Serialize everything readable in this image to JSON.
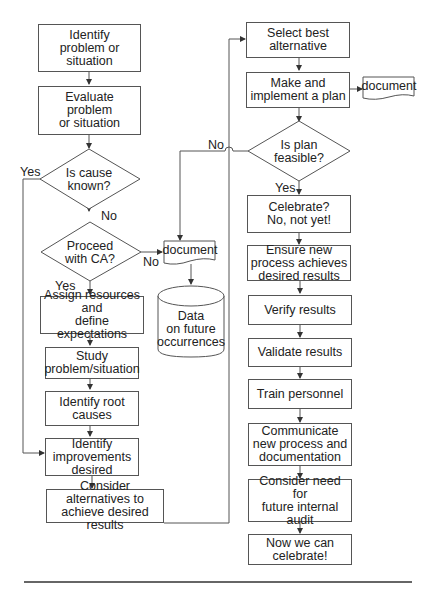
{
  "diagram": {
    "type": "flowchart",
    "nodes": {
      "identify_problem": "Identify\nproblem or\nsituation",
      "evaluate_problem": "Evaluate\nproblem\nor situation",
      "is_cause_known": "Is cause\nknown?",
      "proceed_with_ca": "Proceed\nwith CA?",
      "document_1": "document",
      "data_store": "Data\non future\noccurrences",
      "assign_resources": "Assign resources and\ndefine expectations",
      "study_problem": "Study\nproblem/situation",
      "identify_root_causes": "Identify root\ncauses",
      "identify_improvements": "Identify\nimprovements\ndesired",
      "consider_alternatives": "Consider alternatives to\nachieve desired results",
      "select_best": "Select best\nalternative",
      "make_plan": "Make and\nimplement a plan",
      "document_2": "document",
      "is_plan_feasible": "Is plan\nfeasible?",
      "celebrate_not_yet": "Celebrate?\nNo, not yet!",
      "ensure_process": "Ensure new\nprocess achieves\ndesired results",
      "verify_results": "Verify results",
      "validate_results": "Validate results",
      "train_personnel": "Train personnel",
      "communicate": "Communicate\nnew process and\ndocumentation",
      "consider_audit": "Consider need for\nfuture internal\naudit",
      "now_celebrate": "Now we can\ncelebrate!"
    },
    "edge_labels": {
      "cause_yes": "Yes",
      "cause_no": "No",
      "proceed_yes": "Yes",
      "proceed_no": "No",
      "feasible_no": "No",
      "feasible_yes": "Yes"
    },
    "edges": [
      {
        "from": "identify_problem",
        "to": "evaluate_problem"
      },
      {
        "from": "evaluate_problem",
        "to": "is_cause_known"
      },
      {
        "from": "is_cause_known",
        "to": "proceed_with_ca",
        "label": "No"
      },
      {
        "from": "is_cause_known",
        "to": "identify_improvements",
        "label": "Yes"
      },
      {
        "from": "proceed_with_ca",
        "to": "assign_resources",
        "label": "Yes"
      },
      {
        "from": "proceed_with_ca",
        "to": "document_1",
        "label": "No"
      },
      {
        "from": "document_1",
        "to": "data_store"
      },
      {
        "from": "assign_resources",
        "to": "study_problem"
      },
      {
        "from": "study_problem",
        "to": "identify_root_causes"
      },
      {
        "from": "identify_root_causes",
        "to": "identify_improvements"
      },
      {
        "from": "identify_improvements",
        "to": "consider_alternatives"
      },
      {
        "from": "consider_alternatives",
        "to": "select_best"
      },
      {
        "from": "select_best",
        "to": "make_plan"
      },
      {
        "from": "make_plan",
        "to": "document_2"
      },
      {
        "from": "make_plan",
        "to": "is_plan_feasible"
      },
      {
        "from": "is_plan_feasible",
        "to": "document_1",
        "label": "No"
      },
      {
        "from": "is_plan_feasible",
        "to": "celebrate_not_yet",
        "label": "Yes"
      },
      {
        "from": "celebrate_not_yet",
        "to": "ensure_process"
      },
      {
        "from": "ensure_process",
        "to": "verify_results"
      },
      {
        "from": "verify_results",
        "to": "validate_results"
      },
      {
        "from": "validate_results",
        "to": "train_personnel"
      },
      {
        "from": "train_personnel",
        "to": "communicate"
      },
      {
        "from": "communicate",
        "to": "consider_audit"
      },
      {
        "from": "consider_audit",
        "to": "now_celebrate"
      }
    ],
    "colors": {
      "stroke": "#555555",
      "text": "#222222",
      "background": "#ffffff"
    }
  }
}
